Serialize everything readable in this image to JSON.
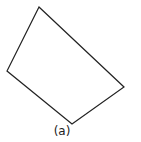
{
  "figure": {
    "label": "(a)",
    "shape": "quadrilateral",
    "vertices": [
      [
        39,
        7
      ],
      [
        124,
        87
      ],
      [
        72,
        124
      ],
      [
        7,
        71
      ]
    ],
    "stroke_color": "#222222",
    "fill_color": "#ffffff"
  }
}
